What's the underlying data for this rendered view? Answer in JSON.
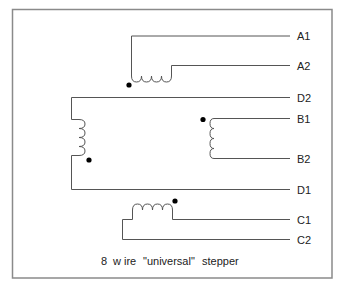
{
  "diagram": {
    "caption": "8 wire \"universal\" stepper",
    "caption_parts": [
      "8",
      "w ire",
      "\"universal\"",
      "stepper"
    ],
    "colors": {
      "wire": "#555555",
      "frame": "#8a8a8a",
      "dot": "#000000",
      "text": "#222222"
    },
    "windings": [
      {
        "name": "A",
        "terminals": [
          "A1",
          "A2"
        ],
        "orientation": "horizontal",
        "polarity_dot": "A1 side"
      },
      {
        "name": "D",
        "terminals": [
          "D2",
          "D1"
        ],
        "orientation": "vertical",
        "polarity_dot": "D1 side"
      },
      {
        "name": "B",
        "terminals": [
          "B1",
          "B2"
        ],
        "orientation": "vertical",
        "polarity_dot": "B1 side"
      },
      {
        "name": "C",
        "terminals": [
          "C1",
          "C2"
        ],
        "orientation": "horizontal",
        "polarity_dot": "C1 side"
      }
    ],
    "labels": {
      "a1": "A1",
      "a2": "A2",
      "d2": "D2",
      "b1": "B1",
      "b2": "B2",
      "d1": "D1",
      "c1": "C1",
      "c2": "C2"
    }
  }
}
